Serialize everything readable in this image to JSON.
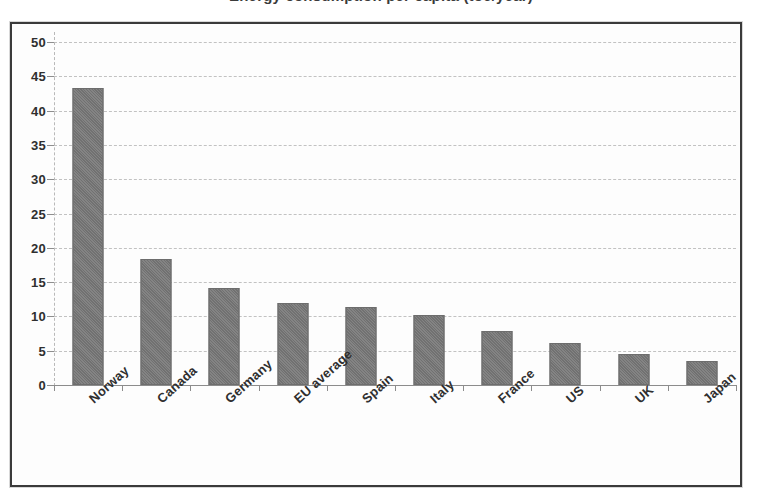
{
  "title": {
    "text": "Energy consumption per capita (toe/year)",
    "visible_note": "clipped at top edge of screenshot"
  },
  "chart_data": {
    "type": "bar",
    "title": "",
    "xlabel": "",
    "ylabel": "",
    "ylim": [
      0,
      50
    ],
    "ytick_step": 5,
    "grid": true,
    "legend": "none",
    "orientation": "vertical",
    "bar_color": "#767676",
    "categories": [
      "Norway",
      "Canada",
      "Germany",
      "EU average",
      "Spain",
      "Italy",
      "France",
      "US",
      "UK",
      "Japan"
    ],
    "values": [
      43.3,
      18.4,
      14.1,
      11.9,
      11.4,
      10.2,
      7.9,
      6.1,
      4.5,
      3.5
    ],
    "ytick_labels": [
      "0",
      "5",
      "10",
      "15",
      "20",
      "25",
      "30",
      "35",
      "40",
      "45",
      "50"
    ],
    "ytick_values": [
      0,
      5,
      10,
      15,
      20,
      25,
      30,
      35,
      40,
      45,
      50
    ]
  },
  "colors": {
    "bar": "#767676",
    "bar_border": "#6d6d6d",
    "frame": "#3a3a3a",
    "gridline": "#c2c2c2",
    "axis": "#8c8c8c",
    "text": "#2f2f2f",
    "background": "#ffffff"
  }
}
